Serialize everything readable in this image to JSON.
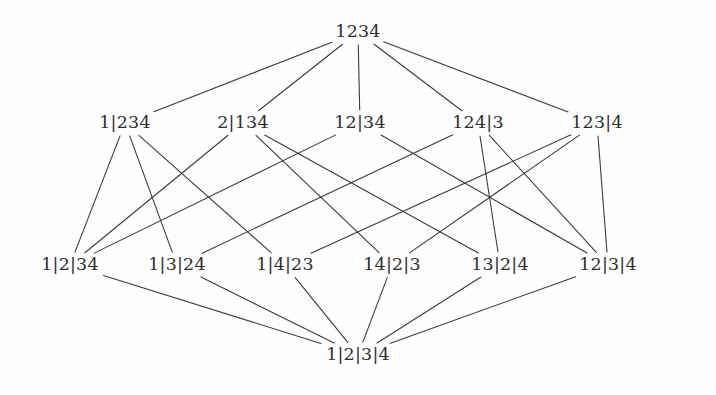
{
  "figure": {
    "width": 716,
    "height": 395,
    "background_color": "#fefefe",
    "edge_color": "#3a3a3a",
    "text_color": "#2e2e2e",
    "edge_width": 1.1
  },
  "chart_data": {
    "type": "diagram",
    "diagram_kind": "hasse-diagram",
    "title": "",
    "ranks": [
      {
        "level": 0,
        "y": 32,
        "nodes": [
          {
            "id": "n1234",
            "label": "1234",
            "x": 358,
            "y": 32
          }
        ]
      },
      {
        "level": 1,
        "y": 123,
        "nodes": [
          {
            "id": "n1_234",
            "label": "1|234",
            "x": 125,
            "y": 123
          },
          {
            "id": "n2_134",
            "label": "2|134",
            "x": 243,
            "y": 123
          },
          {
            "id": "n12_34",
            "label": "12|34",
            "x": 360,
            "y": 123
          },
          {
            "id": "n124_3",
            "label": "124|3",
            "x": 478,
            "y": 123
          },
          {
            "id": "n123_4",
            "label": "123|4",
            "x": 597,
            "y": 123
          }
        ]
      },
      {
        "level": 2,
        "y": 265,
        "nodes": [
          {
            "id": "n1_2_34",
            "label": "1|2|34",
            "x": 70,
            "y": 265
          },
          {
            "id": "n1_3_24",
            "label": "1|3|24",
            "x": 177,
            "y": 265
          },
          {
            "id": "n1_4_23",
            "label": "1|4|23",
            "x": 285,
            "y": 265
          },
          {
            "id": "n14_2_3",
            "label": "14|2|3",
            "x": 392,
            "y": 265
          },
          {
            "id": "n13_2_4",
            "label": "13|2|4",
            "x": 500,
            "y": 265
          },
          {
            "id": "n12_3_4",
            "label": "12|3|4",
            "x": 608,
            "y": 265
          }
        ]
      },
      {
        "level": 3,
        "y": 355,
        "nodes": [
          {
            "id": "n1_2_3_4",
            "label": "1|2|3|4",
            "x": 358,
            "y": 355
          }
        ]
      }
    ],
    "edges": [
      {
        "from": "n1_234",
        "to": "n1234"
      },
      {
        "from": "n2_134",
        "to": "n1234"
      },
      {
        "from": "n12_34",
        "to": "n1234"
      },
      {
        "from": "n124_3",
        "to": "n1234"
      },
      {
        "from": "n123_4",
        "to": "n1234"
      },
      {
        "from": "n1_2_34",
        "to": "n1_234"
      },
      {
        "from": "n1_3_24",
        "to": "n1_234"
      },
      {
        "from": "n1_4_23",
        "to": "n1_234"
      },
      {
        "from": "n1_2_34",
        "to": "n2_134"
      },
      {
        "from": "n14_2_3",
        "to": "n2_134"
      },
      {
        "from": "n13_2_4",
        "to": "n2_134"
      },
      {
        "from": "n1_2_34",
        "to": "n12_34"
      },
      {
        "from": "n12_3_4",
        "to": "n12_34"
      },
      {
        "from": "n1_3_24",
        "to": "n124_3"
      },
      {
        "from": "n13_2_4",
        "to": "n124_3"
      },
      {
        "from": "n12_3_4",
        "to": "n124_3"
      },
      {
        "from": "n1_4_23",
        "to": "n123_4"
      },
      {
        "from": "n14_2_3",
        "to": "n123_4"
      },
      {
        "from": "n12_3_4",
        "to": "n123_4"
      },
      {
        "from": "n1_2_3_4",
        "to": "n1_2_34"
      },
      {
        "from": "n1_2_3_4",
        "to": "n1_3_24"
      },
      {
        "from": "n1_2_3_4",
        "to": "n1_4_23"
      },
      {
        "from": "n1_2_3_4",
        "to": "n14_2_3"
      },
      {
        "from": "n1_2_3_4",
        "to": "n13_2_4"
      },
      {
        "from": "n1_2_3_4",
        "to": "n12_3_4"
      }
    ]
  }
}
